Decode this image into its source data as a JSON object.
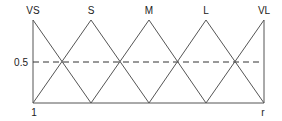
{
  "diagram": {
    "type": "fuzzy-membership-functions",
    "sets": [
      {
        "label": "VS",
        "peak_x": 33
      },
      {
        "label": "S",
        "peak_x": 91
      },
      {
        "label": "M",
        "peak_x": 149
      },
      {
        "label": "L",
        "peak_x": 206
      },
      {
        "label": "VL",
        "peak_x": 264
      }
    ],
    "y_tick_label": "0.5",
    "x_left_label": "1",
    "x_right_label": "r",
    "colors": {
      "line": "#555555",
      "text": "#222222"
    }
  }
}
